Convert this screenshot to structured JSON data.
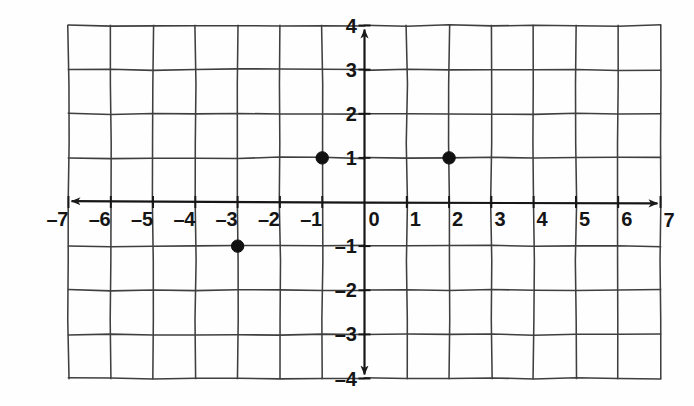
{
  "figure": {
    "kind": "coordinate-plane",
    "background_color": "#fefefe",
    "line_color": "#3a3a3a",
    "axis_color": "#1a1a1a",
    "point_color": "#111111",
    "label_color": "#151515"
  },
  "chart_data": {
    "type": "scatter",
    "title": "",
    "subtitle": "",
    "xlabel": "",
    "ylabel": "",
    "xlim": [
      -7,
      7
    ],
    "ylim": [
      -4,
      4
    ],
    "x_ticks": [
      -7,
      -6,
      -5,
      -4,
      -3,
      -2,
      -1,
      0,
      1,
      2,
      3,
      4,
      5,
      6,
      7
    ],
    "y_ticks": [
      4,
      3,
      2,
      1,
      -1,
      -2,
      -3,
      -4
    ],
    "x_tick_labels": [
      "–7",
      "–6",
      "–5",
      "–4",
      "–3",
      "–2",
      "–1",
      "0",
      "1",
      "2",
      "3",
      "4",
      "5",
      "6",
      "7"
    ],
    "y_tick_labels": [
      "4",
      "3",
      "2",
      "1",
      "–1",
      "–2",
      "–3",
      "–4"
    ],
    "grid": true,
    "grid_step": 1,
    "legend": null,
    "legend_position": "none",
    "axis_arrows": [
      "left",
      "right",
      "up",
      "down"
    ],
    "origin_label": "0",
    "points": [
      {
        "label": "",
        "x": -1,
        "y": 1
      },
      {
        "label": "",
        "x": 2,
        "y": 1
      },
      {
        "label": "",
        "x": -3,
        "y": -1
      }
    ],
    "series": [
      {
        "name": "plotted points",
        "x": [
          -1,
          2,
          -3
        ],
        "y": [
          1,
          1,
          -1
        ]
      }
    ],
    "annotations": []
  }
}
